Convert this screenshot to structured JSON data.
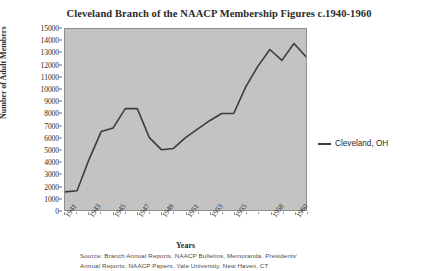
{
  "chart_data": {
    "type": "line",
    "title": "Cleveland Branch of the NAACP Membership Figures c.1940-1960",
    "xlabel": "Years",
    "ylabel": "Number of Adult Members",
    "ylim": [
      0,
      15000
    ],
    "ytick_step": 1000,
    "yticks": [
      "15000",
      "14000",
      "13000",
      "12000",
      "11000",
      "10000",
      "9000",
      "8000",
      "7000",
      "6000",
      "5000",
      "4000",
      "3000",
      "2000",
      "1000",
      "0"
    ],
    "xlim": [
      1941,
      1961
    ],
    "xticks": [
      "1941",
      "1943",
      "1945",
      "1947",
      "1949",
      "1951",
      "1953",
      "1955",
      "1958",
      "1960"
    ],
    "grid": false,
    "legend_position": "right",
    "series": [
      {
        "name": "Cleveland, OH",
        "color": "#3c3c3c",
        "x": [
          1941,
          1942,
          1943,
          1944,
          1945,
          1946,
          1947,
          1948,
          1949,
          1950,
          1951,
          1952,
          1953,
          1954,
          1955,
          1956,
          1957,
          1958,
          1959,
          1960,
          1961
        ],
        "values": [
          1500,
          1600,
          4200,
          6500,
          6800,
          8400,
          8400,
          6000,
          5000,
          5100,
          6000,
          6700,
          7400,
          8000,
          8000,
          10200,
          11900,
          13300,
          12400,
          13800,
          12700
        ]
      }
    ],
    "source_note_line1": "Source:  Branch  Annual  Reports,  NAACP  Bulletins,  Memoranda,  Presidents'",
    "source_note_line2": "Annual Reports, NAACP Papers, Yale University, New Haven, CT"
  }
}
